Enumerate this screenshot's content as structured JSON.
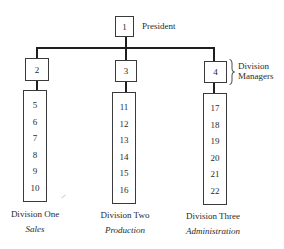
{
  "diagram": {
    "type": "organization-chart",
    "president": {
      "id": "1",
      "title": "President"
    },
    "managers_label": {
      "line1": "Division",
      "line2": "Managers"
    },
    "divisions": [
      {
        "manager_id": "2",
        "name": "Division One",
        "function": "Sales",
        "members": [
          "5",
          "6",
          "7",
          "8",
          "9",
          "10"
        ]
      },
      {
        "manager_id": "3",
        "name": "Division Two",
        "function": "Production",
        "members": [
          "11",
          "12",
          "13",
          "14",
          "15",
          "16"
        ]
      },
      {
        "manager_id": "4",
        "name": "Division Three",
        "function": "Administration",
        "members": [
          "17",
          "18",
          "19",
          "20",
          "21",
          "22"
        ]
      }
    ]
  }
}
